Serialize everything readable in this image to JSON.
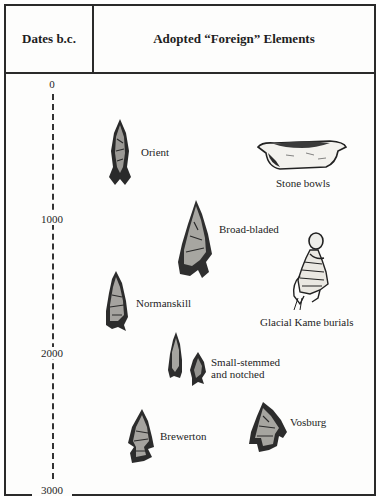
{
  "header": {
    "dates_label": "Dates b.c.",
    "elements_label": "Adopted “Foreign” Elements"
  },
  "axis": {
    "ticks": [
      "0",
      "1000",
      "2000",
      "3000"
    ]
  },
  "elements": [
    {
      "label": "Orient",
      "icon": "projectile-point-icon"
    },
    {
      "label": "Stone bowls",
      "icon": "stone-bowl-icon"
    },
    {
      "label": "Broad-bladed",
      "icon": "projectile-point-icon"
    },
    {
      "label": "Glacial Kame burials",
      "icon": "skeleton-burial-icon"
    },
    {
      "label": "Normanskill",
      "icon": "projectile-point-icon"
    },
    {
      "label_line1": "Small-stemmed",
      "label_line2": "and notched",
      "icon": "projectile-point-icon"
    },
    {
      "label": "Brewerton",
      "icon": "projectile-point-icon"
    },
    {
      "label": "Vosburg",
      "icon": "projectile-point-icon"
    }
  ],
  "colors": {
    "ink": "#1e1e1e",
    "border": "#2a2a2a",
    "paper": "#fdfdfc"
  }
}
